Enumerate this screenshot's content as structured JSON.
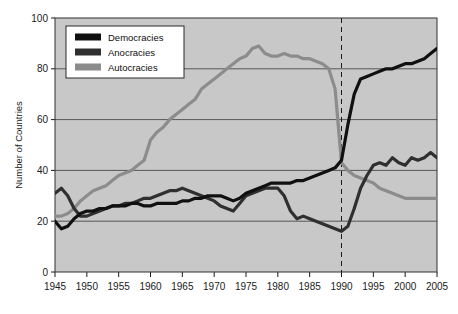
{
  "chart_data": {
    "type": "line",
    "title": "",
    "xlabel": "",
    "ylabel": "Number of Countries",
    "xlim": [
      1945,
      2005
    ],
    "ylim": [
      0,
      100
    ],
    "xticks": [
      1945,
      1950,
      1955,
      1960,
      1965,
      1970,
      1975,
      1980,
      1985,
      1990,
      1995,
      2000,
      2005
    ],
    "yticks": [
      0,
      20,
      40,
      60,
      80,
      100
    ],
    "grid": "horizontal",
    "legend_position": "top-left-inside",
    "plot_background": "#c8c8c8",
    "annotations": [
      {
        "type": "vertical-dashed-line",
        "x": 1990,
        "color": "#1a1a1a"
      }
    ],
    "x": [
      1945,
      1946,
      1947,
      1948,
      1949,
      1950,
      1951,
      1952,
      1953,
      1954,
      1955,
      1956,
      1957,
      1958,
      1959,
      1960,
      1961,
      1962,
      1963,
      1964,
      1965,
      1966,
      1967,
      1968,
      1969,
      1970,
      1971,
      1972,
      1973,
      1974,
      1975,
      1976,
      1977,
      1978,
      1979,
      1980,
      1981,
      1982,
      1983,
      1984,
      1985,
      1986,
      1987,
      1988,
      1989,
      1990,
      1991,
      1992,
      1993,
      1994,
      1995,
      1996,
      1997,
      1998,
      1999,
      2000,
      2001,
      2002,
      2003,
      2004,
      2005
    ],
    "series": [
      {
        "name": "Democracies",
        "color": "#101010",
        "values": [
          20,
          17,
          18,
          21,
          23,
          24,
          24,
          25,
          25,
          26,
          26,
          26,
          27,
          27,
          26,
          26,
          27,
          27,
          27,
          27,
          28,
          28,
          29,
          29,
          30,
          30,
          30,
          29,
          28,
          29,
          31,
          32,
          33,
          34,
          35,
          35,
          35,
          35,
          36,
          36,
          37,
          38,
          39,
          40,
          41,
          44,
          58,
          70,
          76,
          77,
          78,
          79,
          80,
          80,
          81,
          82,
          82,
          83,
          84,
          86,
          88
        ],
        "label_1945": 20,
        "label_2005": 88
      },
      {
        "name": "Anocracies",
        "color": "#2f2f2f",
        "values": [
          31,
          33,
          30,
          25,
          22,
          22,
          23,
          24,
          25,
          26,
          26,
          27,
          27,
          28,
          29,
          29,
          30,
          31,
          32,
          32,
          33,
          32,
          31,
          30,
          29,
          28,
          26,
          25,
          24,
          27,
          30,
          31,
          32,
          33,
          33,
          33,
          30,
          24,
          21,
          22,
          21,
          20,
          19,
          18,
          17,
          16,
          18,
          25,
          33,
          38,
          42,
          43,
          42,
          45,
          43,
          42,
          45,
          44,
          45,
          47,
          45
        ],
        "label_1945": 31,
        "label_2005": 45
      },
      {
        "name": "Autocracies",
        "color": "#8c8c8c",
        "values": [
          22,
          22,
          23,
          25,
          28,
          30,
          32,
          33,
          34,
          36,
          38,
          39,
          40,
          42,
          44,
          52,
          55,
          57,
          60,
          62,
          64,
          66,
          68,
          72,
          74,
          76,
          78,
          80,
          82,
          84,
          85,
          88,
          89,
          86,
          85,
          85,
          86,
          85,
          85,
          84,
          84,
          83,
          82,
          80,
          72,
          43,
          40,
          38,
          37,
          36,
          35,
          33,
          32,
          31,
          30,
          29,
          29,
          29,
          29,
          29,
          29
        ],
        "label_1945": 22,
        "peak": {
          "year": 1977,
          "value": 89
        },
        "label_2005": 29
      }
    ],
    "legend": [
      {
        "label": "Democracies",
        "color": "#101010"
      },
      {
        "label": "Anocracies",
        "color": "#2f2f2f"
      },
      {
        "label": "Autocracies",
        "color": "#8c8c8c"
      }
    ]
  }
}
